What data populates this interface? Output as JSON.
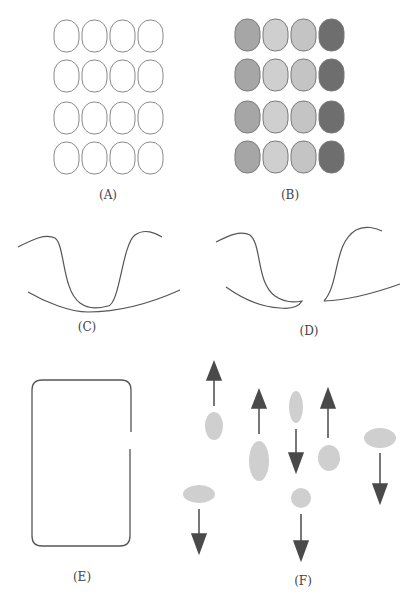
{
  "panels": {
    "A": {
      "label": "(A)",
      "rows": 4,
      "cols": 4,
      "fill": "none",
      "stroke": "#8a8a8a"
    },
    "B": {
      "label": "(B)",
      "rows": 4,
      "cols": 4,
      "column_fills": [
        "#a6a6a6",
        "#cfcfcf",
        "#c4c4c4",
        "#6e6e6e"
      ],
      "stroke": "#7a7a7a"
    },
    "C": {
      "label": "(C)"
    },
    "D": {
      "label": "(D)"
    },
    "E": {
      "label": "(E)"
    },
    "F": {
      "label": "(F)",
      "ellipse_fill": "#cfcfcf",
      "arrow_color": "#4a4a4a"
    }
  },
  "colors": {
    "line": "#555555",
    "label": "#444444"
  }
}
